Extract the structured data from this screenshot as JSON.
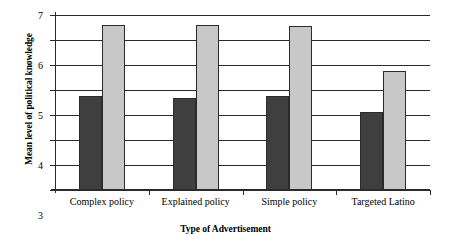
{
  "chart_data": {
    "type": "bar",
    "title": "",
    "subtitle": "",
    "xlabel": "Type of Advertisement",
    "ylabel": "Mean level of political knowledge",
    "categories": [
      "Complex policy",
      "Explained policy",
      "Simple policy",
      "Targeted Latino"
    ],
    "series": [
      {
        "name": "dark-series",
        "color": "#3f3f3f",
        "values": [
          3.75,
          3.7,
          3.77,
          3.13
        ]
      },
      {
        "name": "light-series",
        "color": "#c8c8c8",
        "values": [
          6.6,
          6.6,
          6.55,
          4.78
        ]
      }
    ],
    "ylim": [
      0,
      7
    ],
    "ytick_labels": [
      "0",
      "1",
      "2",
      "3",
      "4",
      "5",
      "6",
      "7"
    ],
    "yticks": [
      0,
      1,
      2,
      3,
      4,
      5,
      6,
      7
    ],
    "grid": true,
    "legend": false,
    "legend_position": "none",
    "bar_outline_color": "#2b2b2b",
    "axis_color": "#2b2b2b",
    "background_color": "#ffffff"
  }
}
